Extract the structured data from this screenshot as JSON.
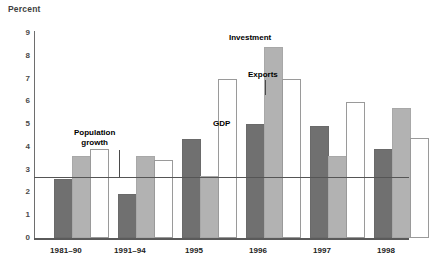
{
  "chart_data": {
    "type": "bar",
    "title": "",
    "ylabel": "Percent",
    "xlabel": "",
    "ylim": [
      0,
      9
    ],
    "yticks": [
      "0",
      "1",
      "2",
      "3",
      "4",
      "5",
      "6",
      "7",
      "8",
      "9"
    ],
    "grid": false,
    "legend_position": "inline-annotations",
    "categories": [
      "1981–90",
      "1991–94",
      "1995",
      "1996",
      "1997",
      "1998"
    ],
    "series": [
      {
        "name": "GDP",
        "color": "#707070",
        "values": [
          2.5,
          1.85,
          4.25,
          4.9,
          4.85,
          3.8
        ]
      },
      {
        "name": "Investment",
        "color": "#b2b2b2",
        "values": [
          3.5,
          3.5,
          2.65,
          8.3,
          3.5,
          5.6
        ]
      },
      {
        "name": "Exports",
        "color": "#ffffff",
        "values": [
          3.8,
          3.35,
          6.9,
          6.9,
          5.9,
          4.3
        ]
      }
    ],
    "annotations": [
      {
        "label": "Population\ngrowth",
        "value": 2.7,
        "type": "reference-line"
      },
      {
        "label": "GDP",
        "type": "series-label"
      },
      {
        "label": "Investment",
        "type": "series-label"
      },
      {
        "label": "Exports",
        "type": "series-label"
      }
    ],
    "reference_line": {
      "label": "Population growth",
      "value": 2.7
    }
  },
  "labels": {
    "y_axis_title": "Percent",
    "population_growth_line1": "Population",
    "population_growth_line2": "growth",
    "gdp": "GDP",
    "investment": "Investment",
    "exports": "Exports"
  }
}
